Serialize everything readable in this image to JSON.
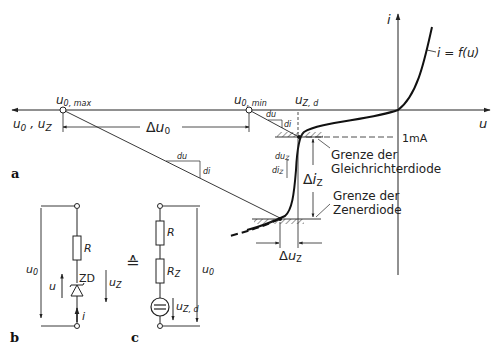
{
  "figure": {
    "panel_a": {
      "label": "a",
      "axes": {
        "y_label": "i",
        "x_label": "u",
        "left_axis_label": "u₀ , u₂",
        "left_axis_text": "u0 , uZ"
      },
      "curve_label": "i = f(u)",
      "points": {
        "u0_max": "u0,max",
        "u0_min": "u0,min",
        "uz_d": "uZ,d"
      },
      "dimensions": {
        "delta_u0": "Δu0",
        "delta_iz": "ΔiZ",
        "delta_uz": "ΔuZ"
      },
      "slope_labels": {
        "du_1": "du",
        "di_1": "di",
        "du_2": "du",
        "di_2": "di",
        "duz": "duZ",
        "diz": "diZ"
      },
      "current_marker": "1mA",
      "annotations": {
        "rectifier_limit_line1": "Grenze der",
        "rectifier_limit_line2": "Gleichrichterdiode",
        "zener_limit_line1": "Grenze der",
        "zener_limit_line2": "Zenerdiode"
      }
    },
    "panel_b": {
      "label": "b",
      "components": {
        "resistor": "R",
        "diode": "ZD"
      },
      "voltages": {
        "source": "u0",
        "diode_voltage": "u",
        "zener_voltage": "uZ"
      },
      "current": "i"
    },
    "equivalence_symbol": "≙",
    "panel_c": {
      "label": "c",
      "components": {
        "resistor": "R",
        "zener_resistance": "RZ",
        "source": "uZ,d"
      },
      "voltages": {
        "source": "u0"
      }
    }
  }
}
